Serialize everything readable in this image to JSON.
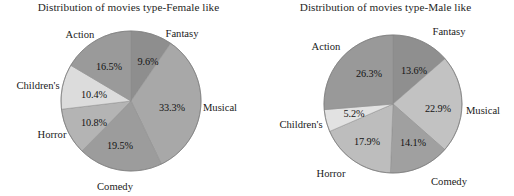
{
  "page": {
    "background": "#ffffff",
    "width": 514,
    "height": 196
  },
  "chart_data": [
    {
      "id": "female",
      "type": "pie",
      "title": "Distribution of movies type-Female like",
      "xlabel": "",
      "ylabel": "",
      "legend": "none",
      "labels_outside": true,
      "start_angle_deg": 0,
      "direction": "clockwise",
      "categories": [
        "Fantasy",
        "Musical",
        "Comedy",
        "Horror",
        "Children's",
        "Action"
      ],
      "values": [
        9.6,
        33.3,
        19.5,
        10.8,
        10.4,
        16.5
      ],
      "value_labels": [
        "9.6%",
        "33.3%",
        "19.5%",
        "10.8%",
        "10.4%",
        "16.5%"
      ],
      "colors": [
        "#8e8e8e",
        "#a8a8a8",
        "#9c9c9c",
        "#b4b4b4",
        "#dcdcdc",
        "#9a9a9a"
      ],
      "center": {
        "x": 131,
        "y": 101
      },
      "radius": 70,
      "slices": [
        {
          "name": "Fantasy",
          "value": 9.6,
          "label": "9.6%",
          "color": "#8e8e8e",
          "pct_x": 148,
          "pct_y": 61,
          "cat_x": 182,
          "cat_y": 33
        },
        {
          "name": "Musical",
          "value": 33.3,
          "label": "33.3%",
          "color": "#a8a8a8",
          "pct_x": 172,
          "pct_y": 107,
          "cat_x": 220,
          "cat_y": 107
        },
        {
          "name": "Comedy",
          "value": 19.5,
          "label": "19.5%",
          "color": "#9c9c9c",
          "pct_x": 120,
          "pct_y": 145,
          "cat_x": 115,
          "cat_y": 186
        },
        {
          "name": "Horror",
          "value": 10.8,
          "label": "10.8%",
          "color": "#b4b4b4",
          "pct_x": 94,
          "pct_y": 122,
          "cat_x": 52,
          "cat_y": 134
        },
        {
          "name": "Children's",
          "value": 10.4,
          "label": "10.4%",
          "color": "#dcdcdc",
          "pct_x": 94,
          "pct_y": 94,
          "cat_x": 38,
          "cat_y": 85
        },
        {
          "name": "Action",
          "value": 16.5,
          "label": "16.5%",
          "color": "#9a9a9a",
          "pct_x": 109,
          "pct_y": 66,
          "cat_x": 80,
          "cat_y": 34
        }
      ]
    },
    {
      "id": "male",
      "type": "pie",
      "title": "Distribution of movies type-Male like",
      "xlabel": "",
      "ylabel": "",
      "legend": "none",
      "labels_outside": true,
      "start_angle_deg": 0,
      "direction": "clockwise",
      "categories": [
        "Fantasy",
        "Musical",
        "Comedy",
        "Horror",
        "Children's",
        "Action"
      ],
      "values": [
        13.6,
        22.9,
        14.1,
        17.9,
        5.2,
        26.3
      ],
      "value_labels": [
        "13.6%",
        "22.9%",
        "14.1%",
        "17.9%",
        "5.2%",
        "26.3%"
      ],
      "colors": [
        "#8f8f8f",
        "#c2c2c2",
        "#a0a0a0",
        "#bdbdbd",
        "#e2e2e2",
        "#999999"
      ],
      "center": {
        "x": 136,
        "y": 104
      },
      "radius": 69,
      "slices": [
        {
          "name": "Fantasy",
          "value": 13.6,
          "label": "13.6%",
          "color": "#8f8f8f",
          "pct_x": 157,
          "pct_y": 70,
          "cat_x": 192,
          "cat_y": 31
        },
        {
          "name": "Musical",
          "value": 22.9,
          "label": "22.9%",
          "color": "#c2c2c2",
          "pct_x": 181,
          "pct_y": 108,
          "cat_x": 226,
          "cat_y": 110
        },
        {
          "name": "Comedy",
          "value": 14.1,
          "label": "14.1%",
          "color": "#a0a0a0",
          "pct_x": 156,
          "pct_y": 142,
          "cat_x": 192,
          "cat_y": 181
        },
        {
          "name": "Horror",
          "value": 17.9,
          "label": "17.9%",
          "color": "#bdbdbd",
          "pct_x": 110,
          "pct_y": 141,
          "cat_x": 74,
          "cat_y": 173
        },
        {
          "name": "Children's",
          "value": 5.2,
          "label": "5.2%",
          "color": "#e2e2e2",
          "pct_x": 97,
          "pct_y": 113,
          "cat_x": 44,
          "cat_y": 124
        },
        {
          "name": "Action",
          "value": 26.3,
          "label": "26.3%",
          "color": "#999999",
          "pct_x": 112,
          "pct_y": 73,
          "cat_x": 69,
          "cat_y": 46
        }
      ]
    }
  ]
}
